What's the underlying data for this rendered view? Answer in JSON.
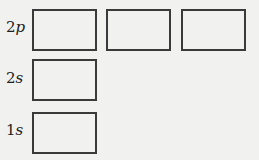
{
  "diagram": {
    "title": "",
    "orbitals": [
      {
        "level": "2",
        "sublevel": "p",
        "boxes": 3
      },
      {
        "level": "2",
        "sublevel": "s",
        "boxes": 1
      },
      {
        "level": "1",
        "sublevel": "s",
        "boxes": 1
      }
    ],
    "labels": {
      "row_2p_num": "2",
      "row_2p_letter": "p",
      "row_2s_num": "2",
      "row_2s_letter": "s",
      "row_1s_num": "1",
      "row_1s_letter": "s"
    }
  }
}
